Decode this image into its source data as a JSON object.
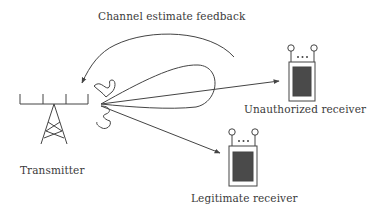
{
  "diagram": {
    "title_arrow_label": "Channel estimate feedback",
    "nodes": {
      "transmitter": {
        "label": "Transmitter"
      },
      "unauthorized": {
        "label": "Unauthorized receiver"
      },
      "legitimate": {
        "label": "Legitimate receiver"
      }
    },
    "edges": [
      {
        "from": "transmitter",
        "to": "unauthorized",
        "type": "signal-arrow"
      },
      {
        "from": "transmitter",
        "to": "legitimate",
        "type": "signal-arrow"
      },
      {
        "from": "unauthorized",
        "to": "transmitter",
        "type": "feedback-arrow",
        "label": "Channel estimate feedback"
      }
    ],
    "colors": {
      "stroke": "#444444",
      "device_screen": "#4a4a4a",
      "text": "#3a3a3a"
    }
  }
}
